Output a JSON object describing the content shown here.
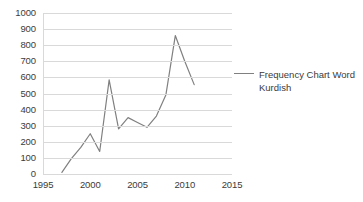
{
  "chart_data": {
    "type": "line",
    "title": "",
    "xlabel": "",
    "ylabel": "",
    "xlim": [
      1995,
      2015
    ],
    "ylim": [
      0,
      1000
    ],
    "grid": true,
    "legend_position": "right",
    "x_ticks": [
      "1995",
      "2000",
      "2005",
      "2010",
      "2015"
    ],
    "y_ticks": [
      "0",
      "100",
      "200",
      "300",
      "400",
      "500",
      "600",
      "700",
      "800",
      "900",
      "1000"
    ],
    "series": [
      {
        "name": "Frequency Chart Word Kurdish",
        "color": "#808080",
        "x": [
          1997,
          1998,
          1999,
          2000,
          2001,
          2002,
          2003,
          2004,
          2005,
          2006,
          2007,
          2008,
          2009,
          2010,
          2011
        ],
        "values": [
          10,
          95,
          165,
          250,
          140,
          585,
          280,
          350,
          320,
          290,
          360,
          490,
          860,
          700,
          555
        ]
      }
    ]
  },
  "legend": {
    "entries": [
      {
        "label": "Frequency Chart Word Kurdish",
        "color": "#808080"
      }
    ]
  },
  "axes": {
    "y_tick_labels": [
      "1000",
      "900",
      "800",
      "700",
      "600",
      "500",
      "400",
      "300",
      "200",
      "100",
      "0"
    ],
    "x_tick_labels": [
      "1995",
      "2000",
      "2005",
      "2010",
      "2015"
    ]
  }
}
